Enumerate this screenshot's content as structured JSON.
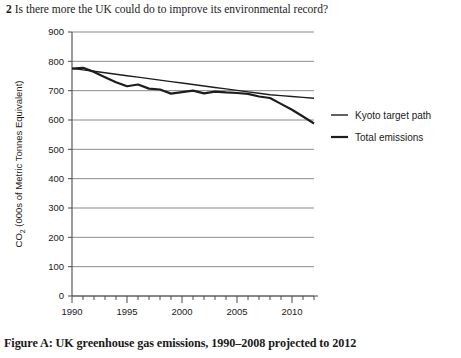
{
  "question": {
    "number": "2",
    "text": "Is there more the UK could do to improve its environmental record?"
  },
  "caption": "Figure A: UK greenhouse gas emissions, 1990–2008 projected to 2012",
  "legend": {
    "position": "right",
    "items": [
      {
        "label": "Kyoto target path",
        "swatch": "legend-line-kyoto"
      },
      {
        "label": "Total emissions",
        "swatch": "legend-line-total"
      }
    ]
  },
  "chart_data": {
    "type": "line",
    "title": "UK greenhouse gas emissions, 1990–2008 projected to 2012",
    "xlabel": "",
    "ylabel": "CO₂ (000s of Metric Tonnes Equivalent)",
    "ylabel_main": "CO",
    "ylabel_sub": "2",
    "ylabel_rest": " (000s of Metric Tonnes Equivalent)",
    "xlim": [
      1990,
      2012
    ],
    "ylim": [
      0,
      900
    ],
    "yticks": [
      0,
      100,
      200,
      300,
      400,
      500,
      600,
      700,
      800,
      900
    ],
    "ytick_labels": [
      "0",
      "100",
      "200",
      "300",
      "400",
      "500",
      "600",
      "700",
      "800",
      "900"
    ],
    "xticks_major": [
      1990,
      1995,
      2000,
      2005,
      2010
    ],
    "xtick_labels": [
      "1990",
      "1995",
      "2000",
      "2005",
      "2010"
    ],
    "xticks_minor": [
      1991,
      1992,
      1993,
      1994,
      1996,
      1997,
      1998,
      1999,
      2001,
      2002,
      2003,
      2004,
      2006,
      2007,
      2008,
      2009,
      2011,
      2012
    ],
    "grid": "horizontal",
    "x": [
      1990,
      1991,
      1992,
      1993,
      1994,
      1995,
      1996,
      1997,
      1998,
      1999,
      2000,
      2001,
      2002,
      2003,
      2004,
      2005,
      2006,
      2007,
      2008,
      2009,
      2010,
      2011,
      2012
    ],
    "series": [
      {
        "name": "Kyoto target path",
        "stroke_width": 1.4,
        "values": [
          776,
          771,
          766,
          761,
          756,
          751,
          746,
          741,
          736,
          731,
          726,
          721,
          716,
          711,
          706,
          701,
          696,
          691,
          686,
          683,
          680,
          677,
          674
        ]
      },
      {
        "name": "Total emissions",
        "stroke_width": 2.2,
        "values": [
          775,
          778,
          764,
          746,
          729,
          715,
          721,
          707,
          704,
          690,
          695,
          700,
          691,
          697,
          694,
          692,
          689,
          680,
          675,
          655,
          635,
          612,
          588
        ]
      }
    ]
  }
}
